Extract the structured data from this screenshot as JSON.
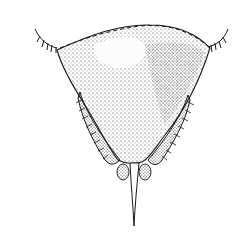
{
  "figure": {
    "background": "#ffffff",
    "ink": "#1a1a1a",
    "stipple": "#333333"
  }
}
